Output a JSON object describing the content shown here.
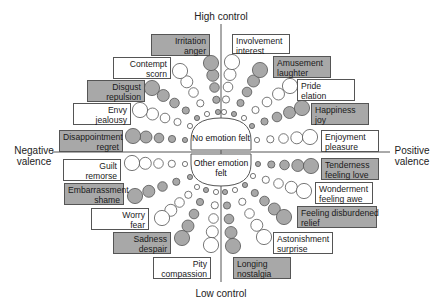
{
  "axes": {
    "top": "High control",
    "bottom": "Low control",
    "left_line1": "Negative",
    "left_line2": "valence",
    "right_line1": "Positive",
    "right_line2": "valence"
  },
  "center": {
    "no_emotion": "No emotion felt",
    "other_emotion_line1": "Other emotion",
    "other_emotion_line2": "felt"
  },
  "colors": {
    "grey_fill": "#a8a8a8",
    "white_fill": "#ffffff",
    "stroke": "#555555"
  },
  "emotions": [
    {
      "id": "irritation",
      "line1": "Irritation",
      "line2": "anger",
      "shaded": true,
      "quadrant": "top-left"
    },
    {
      "id": "contempt",
      "line1": "Contempt",
      "line2": "scorn",
      "shaded": false,
      "quadrant": "top-left"
    },
    {
      "id": "disgust",
      "line1": "Disgust",
      "line2": "repulsion",
      "shaded": true,
      "quadrant": "top-left"
    },
    {
      "id": "envy",
      "line1": "Envy",
      "line2": "jealousy",
      "shaded": false,
      "quadrant": "top-left"
    },
    {
      "id": "disappointment",
      "line1": "Disappointment",
      "line2": "regret",
      "shaded": true,
      "quadrant": "top-left"
    },
    {
      "id": "involvement",
      "line1": "Involvement",
      "line2": "interest",
      "shaded": false,
      "quadrant": "top-right"
    },
    {
      "id": "amusement",
      "line1": "Amusement",
      "line2": "laughter",
      "shaded": true,
      "quadrant": "top-right"
    },
    {
      "id": "pride",
      "line1": "Pride",
      "line2": "elation",
      "shaded": false,
      "quadrant": "top-right"
    },
    {
      "id": "happiness",
      "line1": "Happiness",
      "line2": "joy",
      "shaded": true,
      "quadrant": "top-right"
    },
    {
      "id": "enjoyment",
      "line1": "Enjoyment",
      "line2": "pleasure",
      "shaded": false,
      "quadrant": "top-right"
    },
    {
      "id": "guilt",
      "line1": "Guilt",
      "line2": "remorse",
      "shaded": false,
      "quadrant": "bottom-left"
    },
    {
      "id": "embarrassment",
      "line1": "Embarrassment",
      "line2": "shame",
      "shaded": true,
      "quadrant": "bottom-left"
    },
    {
      "id": "worry",
      "line1": "Worry",
      "line2": "fear",
      "shaded": false,
      "quadrant": "bottom-left"
    },
    {
      "id": "sadness",
      "line1": "Sadness",
      "line2": "despair",
      "shaded": true,
      "quadrant": "bottom-left"
    },
    {
      "id": "pity",
      "line1": "Pity",
      "line2": "compassion",
      "shaded": false,
      "quadrant": "bottom-left"
    },
    {
      "id": "tenderness",
      "line1": "Tenderness",
      "line2": "feeling love",
      "shaded": true,
      "quadrant": "bottom-right"
    },
    {
      "id": "wonderment",
      "line1": "Wonderment",
      "line2": "feeling awe",
      "shaded": false,
      "quadrant": "bottom-right"
    },
    {
      "id": "disburdened",
      "line1": "Feeling disburdened",
      "line2": "relief",
      "shaded": true,
      "quadrant": "bottom-right"
    },
    {
      "id": "astonishment",
      "line1": "Astonishment",
      "line2": "surprise",
      "shaded": false,
      "quadrant": "bottom-right"
    },
    {
      "id": "longing",
      "line1": "Longing",
      "line2": "nostalgia",
      "shaded": true,
      "quadrant": "bottom-right"
    }
  ],
  "intensity_levels": 5
}
